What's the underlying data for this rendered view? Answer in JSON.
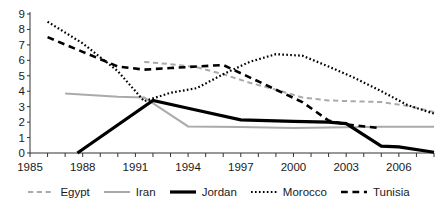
{
  "chart_data": {
    "type": "line",
    "title": "",
    "xlabel": "",
    "ylabel": "",
    "xlim": [
      1985,
      2008
    ],
    "ylim": [
      0,
      9
    ],
    "grid": false,
    "legend_position": "bottom",
    "x_ticks": [
      1985,
      1988,
      1991,
      1994,
      1997,
      2000,
      2003,
      2006
    ],
    "x_minor_tick_interval": 1,
    "y_ticks": [
      0,
      1,
      2,
      3,
      4,
      5,
      6,
      7,
      8,
      9
    ],
    "series": [
      {
        "name": "Egypt",
        "color": "#aaaaaa",
        "style": "dashed",
        "width": 2,
        "x": [
          1991.5,
          1993,
          1994.5,
          1996,
          1997.5,
          1999,
          2000.5,
          2002,
          2003.5,
          2005,
          2006.5,
          2008
        ],
        "values": [
          5.9,
          5.75,
          5.55,
          5.1,
          4.55,
          4.1,
          3.6,
          3.4,
          3.35,
          3.3,
          3.05,
          2.65
        ]
      },
      {
        "name": "Iran",
        "color": "#aaaaaa",
        "style": "solid",
        "width": 2,
        "x": [
          1987,
          1990,
          1991.5,
          1994,
          1997,
          2000,
          2002,
          2005,
          2008
        ],
        "values": [
          3.85,
          3.65,
          3.6,
          1.72,
          1.68,
          1.62,
          1.65,
          1.7,
          1.7
        ]
      },
      {
        "name": "Jordan",
        "color": "#000000",
        "style": "solid",
        "width": 3.2,
        "x": [
          1987.7,
          1992,
          1994,
          1997,
          2000,
          2002,
          2003,
          2005,
          2006,
          2008
        ],
        "values": [
          0.0,
          3.4,
          2.9,
          2.15,
          2.05,
          2.0,
          1.9,
          0.45,
          0.4,
          0.05
        ]
      },
      {
        "name": "Morocco",
        "color": "#000000",
        "style": "dotted",
        "width": 2.2,
        "x": [
          1986,
          1988,
          1990,
          1991.5,
          1993,
          1994.5,
          1996,
          1997.5,
          1999,
          2000.5,
          2002,
          2003.5,
          2005,
          2006.5,
          2008
        ],
        "values": [
          8.5,
          7.1,
          5.3,
          3.35,
          3.9,
          4.2,
          5.1,
          5.9,
          6.4,
          6.3,
          5.6,
          4.85,
          4.0,
          3.1,
          2.55
        ]
      },
      {
        "name": "Tunisia",
        "color": "#000000",
        "style": "dashed",
        "width": 2.6,
        "x": [
          1986,
          1988,
          1990,
          1991.5,
          1993,
          1994.5,
          1996,
          1997.5,
          1999,
          2000.5,
          2002,
          2003,
          2005
        ],
        "values": [
          7.5,
          6.55,
          5.6,
          5.4,
          5.5,
          5.6,
          5.7,
          4.9,
          4.1,
          3.3,
          2.1,
          1.85,
          1.6
        ]
      }
    ]
  },
  "legend": {
    "items": [
      {
        "label": "Egypt"
      },
      {
        "label": "Iran"
      },
      {
        "label": "Jordan"
      },
      {
        "label": "Morocco"
      },
      {
        "label": "Tunisia"
      }
    ]
  },
  "axis": {
    "y_tick_labels": [
      "0",
      "1",
      "2",
      "3",
      "4",
      "5",
      "6",
      "7",
      "8",
      "9"
    ],
    "x_tick_labels": [
      "1985",
      "1988",
      "1991",
      "1994",
      "1997",
      "2000",
      "2003",
      "2006"
    ]
  }
}
